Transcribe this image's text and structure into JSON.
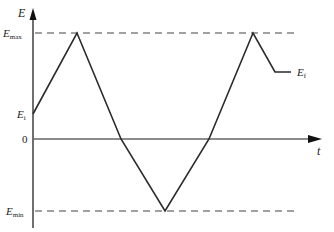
{
  "figure": {
    "type": "triangular potential waveform",
    "y_axis": {
      "label": "E"
    },
    "x_axis": {
      "label": "t"
    },
    "levels": [
      {
        "key": "E_max",
        "main": "E",
        "sub": "max",
        "style": "dashed"
      },
      {
        "key": "E_i",
        "main": "E",
        "sub": "i",
        "style": "tick"
      },
      {
        "key": "zero",
        "main": "0",
        "sub": "",
        "style": "axis"
      },
      {
        "key": "E_min",
        "main": "E",
        "sub": "min",
        "style": "dashed"
      }
    ],
    "end_label": {
      "main": "E",
      "sub": "f"
    },
    "waveform_points": [
      {
        "t": 0,
        "level": "E_i"
      },
      {
        "t": 1,
        "level": "E_max"
      },
      {
        "t": 2,
        "level": "zero"
      },
      {
        "t": 3,
        "level": "E_min"
      },
      {
        "t": 4,
        "level": "zero"
      },
      {
        "t": 5,
        "level": "E_max"
      },
      {
        "t": 5.5,
        "level": "E_f"
      },
      {
        "t": 5.9,
        "level": "E_f"
      }
    ]
  },
  "labels": {
    "E_axis": "E",
    "t_axis": "t",
    "Emax_main": "E",
    "Emax_sub": "max",
    "Ei_main": "E",
    "Ei_sub": "i",
    "zero": "0",
    "Emin_main": "E",
    "Emin_sub": "min",
    "Ef_main": "E",
    "Ef_sub": "f"
  },
  "colors": {
    "line": "#2a2a2a",
    "axis": "#555555",
    "background": "#ffffff"
  }
}
